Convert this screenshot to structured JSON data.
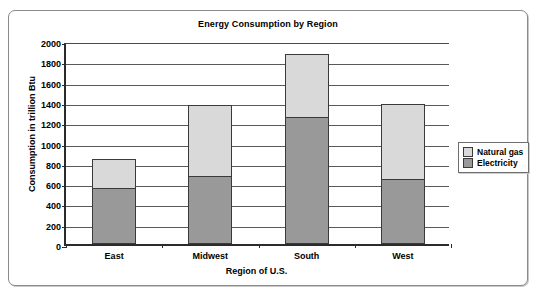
{
  "chart_data": {
    "type": "bar",
    "subtype": "stacked",
    "title": "Energy Consumption by Region",
    "xlabel": "Region of U.S.",
    "ylabel": "Consumption in trillion Btu",
    "categories": [
      "East",
      "Midwest",
      "South",
      "West"
    ],
    "series": [
      {
        "name": "Electricity",
        "color": "#999999",
        "values": [
          550,
          670,
          1255,
          640
        ]
      },
      {
        "name": "Natural gas",
        "color": "#d9d9d9",
        "values": [
          290,
          700,
          615,
          735
        ]
      }
    ],
    "totals": [
      840,
      1370,
      1870,
      1375
    ],
    "ylim": [
      0,
      2000
    ],
    "ytick_step": 200,
    "yticks": [
      2000,
      1800,
      1600,
      1400,
      1200,
      1000,
      800,
      600,
      400,
      200,
      0
    ],
    "ytick_labels": [
      "2000",
      "1800",
      "1600",
      "1400",
      "1200",
      "1000",
      "800",
      "600",
      "400",
      "200",
      "0"
    ],
    "grid": true,
    "grid_axis": "y",
    "legend_position": "right",
    "legend_entries": [
      "Natural gas",
      "Electricity"
    ],
    "stack_order_bottom_to_top": [
      "Electricity",
      "Natural gas"
    ]
  },
  "legend": {
    "items": [
      {
        "label": "Natural gas",
        "color": "#d9d9d9"
      },
      {
        "label": "Electricity",
        "color": "#999999"
      }
    ]
  },
  "colors": {
    "natural_gas": "#d9d9d9",
    "electricity": "#999999",
    "axis": "#2b2b2b",
    "grid": "#5a5a5a",
    "frame": "#8a8a8a",
    "background": "#ffffff"
  }
}
